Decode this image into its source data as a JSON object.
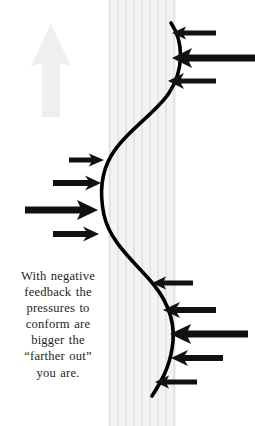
{
  "figure": {
    "background_color": "#ffffff",
    "width": 255,
    "height": 426
  },
  "caption": {
    "lines": [
      "With negative",
      "feedback the",
      "pressures to",
      "conform are",
      "bigger the",
      "“farther out”",
      "you are."
    ],
    "full_text": "With negative feedback the pressures to conform are bigger the “farther out” you are.",
    "color": "#231f20"
  },
  "curve": {
    "name": "s-curve",
    "color": "#000000",
    "stroke_width": 3.6,
    "description": "Sigmoid deviation curve bulging right at top, left at middle, right at bottom"
  },
  "center_band": {
    "name": "equilibrium-band",
    "color": "#eceaea",
    "stripe_color": "#e4e2e2",
    "stripe_count": 9,
    "x_start": 108,
    "x_end": 176
  },
  "gray_arrow": {
    "name": "time-direction-arrow",
    "direction": "up",
    "color": "#efefef"
  },
  "arrow_groups": [
    {
      "name": "upper-right-pressure-arrows",
      "direction": "left",
      "color": "#000000",
      "count": 3,
      "arrows": [
        {
          "label": "upper-right-arrow-1",
          "weight": "thin",
          "length": 44,
          "y": 33
        },
        {
          "label": "upper-right-arrow-2",
          "weight": "thick",
          "length": 83,
          "y": 58
        },
        {
          "label": "upper-right-arrow-3",
          "weight": "medium",
          "length": 48,
          "y": 81
        }
      ]
    },
    {
      "name": "middle-left-pressure-arrows",
      "direction": "right",
      "color": "#000000",
      "count": 4,
      "arrows": [
        {
          "label": "middle-left-arrow-1",
          "weight": "thin",
          "length": 35,
          "y": 160
        },
        {
          "label": "middle-left-arrow-2",
          "weight": "medium",
          "length": 48,
          "y": 183
        },
        {
          "label": "middle-left-arrow-3",
          "weight": "thick",
          "length": 73,
          "y": 210
        },
        {
          "label": "middle-left-arrow-4",
          "weight": "medium",
          "length": 46,
          "y": 234
        }
      ]
    },
    {
      "name": "lower-right-pressure-arrows",
      "direction": "left",
      "color": "#000000",
      "count": 5,
      "arrows": [
        {
          "label": "lower-right-arrow-1",
          "weight": "thin",
          "length": 41,
          "y": 283
        },
        {
          "label": "lower-right-arrow-2",
          "weight": "medium",
          "length": 53,
          "y": 310
        },
        {
          "label": "lower-right-arrow-3",
          "weight": "thick",
          "length": 78,
          "y": 334
        },
        {
          "label": "lower-right-arrow-4",
          "weight": "medium",
          "length": 52,
          "y": 358
        },
        {
          "label": "lower-right-arrow-5",
          "weight": "thin",
          "length": 42,
          "y": 382
        }
      ]
    }
  ]
}
